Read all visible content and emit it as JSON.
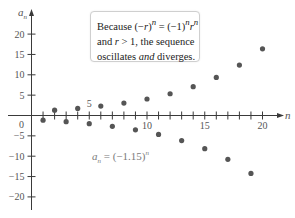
{
  "chart_data": {
    "type": "scatter",
    "title": "",
    "xlabel": "n",
    "ylabel": "a_n",
    "formula": "a_n = (-1.15)^n",
    "formula_parts": {
      "lhs_var": "a",
      "lhs_sub": "n",
      "rhs_base": " = (−1.15)",
      "rhs_exp": "n"
    },
    "annotation": {
      "line1_pre": "Because (−",
      "line1_r": "r",
      "line1_mid": ")",
      "line1_exp1": "n",
      "line1_eq": " = (−1)",
      "line1_exp2": "n",
      "line1_r2": "r",
      "line1_exp3": "n",
      "line2_pre": "and ",
      "line2_r": "r",
      "line2_post": " > 1, the sequence",
      "line3_pre": "oscillates ",
      "line3_and": "and",
      "line3_post": " diverges."
    },
    "xlim": [
      0,
      21
    ],
    "ylim": [
      -23,
      23
    ],
    "x_ticks": [
      1,
      2,
      3,
      4,
      5,
      6,
      7,
      8,
      9,
      10,
      11,
      12,
      13,
      14,
      15,
      16,
      17,
      18,
      19,
      20
    ],
    "x_tick_labels": [
      {
        "value": 5,
        "label": "5"
      },
      {
        "value": 10,
        "label": "10"
      },
      {
        "value": 15,
        "label": "15"
      },
      {
        "value": 20,
        "label": "20"
      }
    ],
    "y_tick_labels": [
      {
        "value": 20,
        "label": "20"
      },
      {
        "value": 15,
        "label": "15"
      },
      {
        "value": 10,
        "label": "10"
      },
      {
        "value": 5,
        "label": "5"
      },
      {
        "value": -5,
        "label": "−5"
      },
      {
        "value": -10,
        "label": "−10"
      },
      {
        "value": -15,
        "label": "−15"
      },
      {
        "value": -20,
        "label": "−20"
      }
    ],
    "origin_label": "0",
    "grid": false,
    "series": [
      {
        "name": "a_n = (-1.15)^n",
        "x": [
          1,
          2,
          3,
          4,
          5,
          6,
          7,
          8,
          9,
          10,
          11,
          12,
          13,
          14,
          15,
          16,
          17,
          18,
          19,
          20
        ],
        "y": [
          -1.15,
          1.32,
          -1.52,
          1.75,
          -2.01,
          2.31,
          -2.66,
          3.06,
          -3.52,
          4.05,
          -4.65,
          5.35,
          -6.15,
          7.08,
          -8.14,
          9.36,
          -10.76,
          12.38,
          -14.23,
          16.37
        ]
      }
    ],
    "colors": {
      "dots": "#555555",
      "axis": "#3a3a3a",
      "formula": "#7a7a7a"
    }
  }
}
